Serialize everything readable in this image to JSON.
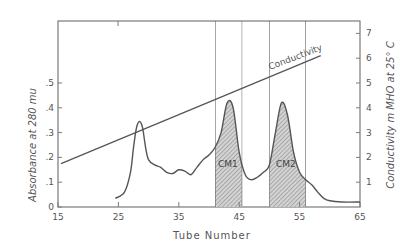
{
  "chart_data": {
    "type": "line",
    "title": "",
    "xlabel": "Tube Number",
    "ylabel": "Absorbance at 280 mu",
    "y2label": "Conductivity m MHO at 25° C",
    "xlim": [
      15,
      65
    ],
    "ylim": [
      0,
      0.75
    ],
    "y2lim": [
      0,
      7.5
    ],
    "x_ticks": [
      "15",
      "25",
      "35",
      "45",
      "55",
      "65"
    ],
    "y_ticks": [
      "0",
      ".1",
      ".2",
      ".3",
      ".4",
      ".5"
    ],
    "y2_ticks": [
      "1",
      "2",
      "3",
      "4",
      "5",
      "6",
      "7"
    ],
    "grid": false,
    "series": [
      {
        "name": "Absorbance",
        "axis": "left",
        "x": [
          24.5,
          26,
          27,
          27.5,
          28,
          28.5,
          29,
          29.5,
          30,
          31,
          32,
          33,
          34,
          35,
          36,
          37,
          38,
          39,
          40,
          41,
          42,
          43,
          44,
          45,
          46,
          47,
          48,
          49,
          50,
          51,
          52,
          53,
          54,
          55,
          56,
          57,
          58,
          59,
          60,
          62,
          65
        ],
        "y": [
          0.035,
          0.06,
          0.14,
          0.24,
          0.32,
          0.345,
          0.32,
          0.24,
          0.19,
          0.17,
          0.16,
          0.14,
          0.135,
          0.15,
          0.145,
          0.13,
          0.16,
          0.19,
          0.21,
          0.24,
          0.3,
          0.42,
          0.4,
          0.22,
          0.13,
          0.11,
          0.12,
          0.14,
          0.17,
          0.3,
          0.42,
          0.37,
          0.22,
          0.14,
          0.11,
          0.09,
          0.06,
          0.035,
          0.025,
          0.02,
          0.02
        ]
      },
      {
        "name": "Conductivity",
        "axis": "right",
        "x": [
          15.5,
          58.5
        ],
        "y": [
          1.75,
          6.1
        ]
      }
    ],
    "annotations": [
      {
        "text": "Conductivity",
        "x": 51,
        "y2": 5.8
      },
      {
        "text": "CM1",
        "x": 43,
        "shaded_range": [
          41,
          45.5
        ]
      },
      {
        "text": "CM2",
        "x": 52.7,
        "shaded_range": [
          50,
          56
        ]
      }
    ]
  }
}
